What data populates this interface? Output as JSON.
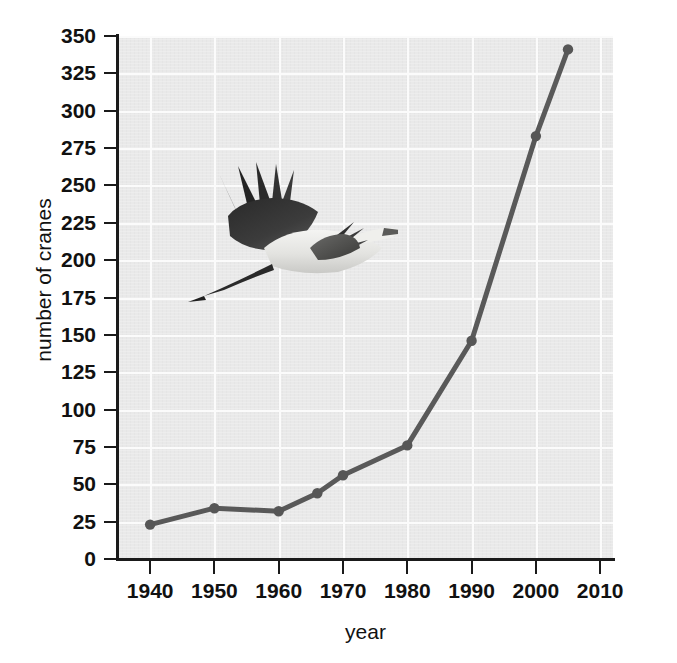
{
  "chart_data": {
    "type": "line",
    "title": "",
    "xlabel": "year",
    "ylabel": "number of cranes",
    "x": [
      1940,
      1950,
      1960,
      1966,
      1970,
      1980,
      1990,
      2000,
      2005
    ],
    "values": [
      23,
      34,
      32,
      44,
      56,
      76,
      146,
      283,
      341
    ],
    "series": [
      {
        "name": "number of cranes",
        "x": [
          1940,
          1950,
          1960,
          1966,
          1970,
          1980,
          1990,
          2000,
          2005
        ],
        "values": [
          23,
          34,
          32,
          44,
          56,
          76,
          146,
          283,
          341
        ]
      }
    ],
    "xlim": [
      1935,
      2012
    ],
    "ylim": [
      0,
      350
    ],
    "xticks": [
      1940,
      1950,
      1960,
      1970,
      1980,
      1990,
      2000,
      2010
    ],
    "yticks": [
      0,
      25,
      50,
      75,
      100,
      125,
      150,
      175,
      200,
      225,
      250,
      275,
      300,
      325,
      350
    ],
    "xtick_labels": [
      "1940",
      "1950",
      "1960",
      "1970",
      "1980",
      "1990",
      "2000",
      "2010"
    ],
    "ytick_labels": [
      "0",
      "25",
      "50",
      "75",
      "100",
      "125",
      "150",
      "175",
      "200",
      "225",
      "250",
      "275",
      "300",
      "325",
      "350"
    ],
    "grid": true,
    "legend": "none",
    "colors": {
      "line": "#595959",
      "marker": "#565656",
      "plot_background": "#e9e9e9",
      "gridline": "#fbfbfb",
      "axis": "#1a1a1a",
      "text": "#111111",
      "figure_background": "#ffffff"
    },
    "annotations": [
      {
        "name": "crane-photo",
        "description": "photograph of a whooping crane in flight"
      }
    ]
  }
}
